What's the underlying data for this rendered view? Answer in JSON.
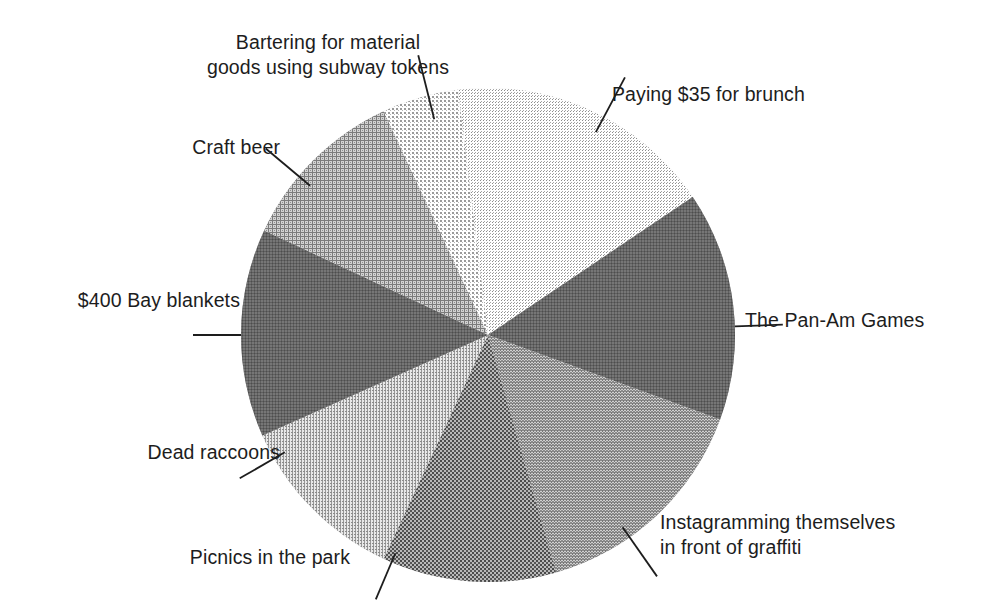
{
  "figure": {
    "background": "#ffffff",
    "text_color": "#1d1d1d",
    "center_x": 488,
    "center_y": 335,
    "radius": 247
  },
  "chart_data": {
    "type": "pie",
    "title": "",
    "subtitle": "",
    "xlabel": "",
    "ylabel": "",
    "grid": false,
    "legend": "none",
    "labels_placement": "outside-with-leader-lines",
    "start_angle_deg": -97,
    "direction": "clockwise",
    "categories": [
      "Paying $35 for brunch",
      "The Pan-Am Games",
      "Instagramming themselves in front of graffiti",
      "Picnics in the park",
      "Dead raccoons",
      "$400 Bay blankets",
      "Craft beer",
      "Bartering for material goods using subway tokens"
    ],
    "values": [
      17.5,
      15.0,
      15.0,
      11.5,
      11.5,
      13.5,
      11.0,
      5.0
    ],
    "value_unit": "percent",
    "slices": [
      {
        "label": "Paying $35 for brunch",
        "label_line1": "Paying $35 for brunch",
        "label_line2": "",
        "value": 17.5,
        "start_deg": -97,
        "end_deg": -34,
        "fill": "#d9d9d9",
        "pattern": "fine-dot-light",
        "leader_from_deg": -60,
        "label_side": "right"
      },
      {
        "label": "The Pan-Am Games",
        "label_line1": "The Pan-Am Games",
        "label_line2": "",
        "value": 15.0,
        "start_deg": -34,
        "end_deg": 20,
        "fill": "#6e6e6e",
        "pattern": "dense-dark",
        "leader_from_deg": -3,
        "label_side": "right"
      },
      {
        "label": "Instagramming themselves in front of graffiti",
        "label_line1": "Instagramming themselves",
        "label_line2": "in front of graffiti",
        "value": 15.0,
        "start_deg": 20,
        "end_deg": 74,
        "fill": "#a6a6a6",
        "pattern": "medium-dot",
        "leader_from_deg": 52,
        "label_side": "right"
      },
      {
        "label": "Picnics in the park",
        "label_line1": "Picnics in the park",
        "label_line2": "",
        "value": 11.5,
        "start_deg": 74,
        "end_deg": 115,
        "fill": "#7d7d7d",
        "pattern": "coarse-crosshatch-dark",
        "leader_from_deg": 112,
        "label_side": "left"
      },
      {
        "label": "Dead raccoons",
        "label_line1": "Dead raccoons",
        "label_line2": "",
        "value": 11.5,
        "start_deg": 115,
        "end_deg": 156,
        "fill": "#b5b5b5",
        "pattern": "light-medium-dot",
        "leader_from_deg": 148,
        "label_side": "left"
      },
      {
        "label": "$400 Bay blankets",
        "label_line1": "$400 Bay blankets",
        "label_line2": "",
        "value": 13.5,
        "start_deg": 156,
        "end_deg": 205,
        "fill": "#747474",
        "pattern": "dense-dark",
        "leader_from_deg": 180,
        "label_side": "left"
      },
      {
        "label": "Craft beer",
        "label_line1": "Craft beer",
        "label_line2": "",
        "value": 11.0,
        "start_deg": 205,
        "end_deg": 245,
        "fill": "#9b9b9b",
        "pattern": "medium-crosshatch",
        "leader_from_deg": 222,
        "label_side": "left"
      },
      {
        "label": "Bartering for material goods using subway tokens",
        "label_line1": "Bartering for material",
        "label_line2": "goods using subway tokens",
        "value": 5.0,
        "start_deg": 245,
        "end_deg": 263,
        "fill": "#c6c6c6",
        "pattern": "light-dot",
        "leader_from_deg": 255,
        "label_side": "top"
      }
    ]
  },
  "labels": {
    "bartering_line1": "Bartering for material",
    "bartering_line2": "goods using subway tokens",
    "paying": "Paying $35 for brunch",
    "panam": "The Pan-Am Games",
    "insta_line1": "Instagramming themselves",
    "insta_line2": "in front of graffiti",
    "picnics": "Picnics in the park",
    "raccoons": "Dead raccoons",
    "bay": "$400 Bay blankets",
    "craft": "Craft beer"
  }
}
